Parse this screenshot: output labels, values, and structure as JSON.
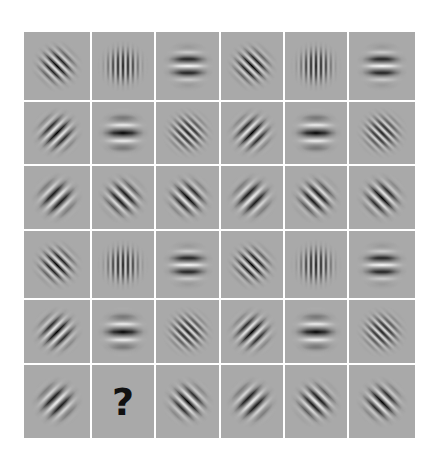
{
  "puzzle": {
    "title": "Gabor patch matrix puzzle",
    "rows": 6,
    "cols": 6,
    "background_color": "#a9a9a9",
    "gridline_color": "#ffffff",
    "missing_marker": "?",
    "missing_position": {
      "row": 6,
      "col": 2
    },
    "cells": [
      [
        {
          "type": "gabor",
          "orientation": "diagonal-down",
          "angle": 45,
          "period": 7,
          "phase": "dark-center"
        },
        {
          "type": "gabor",
          "orientation": "vertical",
          "angle": 0,
          "period": 5,
          "phase": "dark-center"
        },
        {
          "type": "gabor",
          "orientation": "horizontal",
          "angle": 90,
          "period": 14,
          "phase": "light-center"
        },
        {
          "type": "gabor",
          "orientation": "diagonal-down",
          "angle": 45,
          "period": 7,
          "phase": "dark-center"
        },
        {
          "type": "gabor",
          "orientation": "vertical",
          "angle": 0,
          "period": 5,
          "phase": "dark-center"
        },
        {
          "type": "gabor",
          "orientation": "horizontal",
          "angle": 90,
          "period": 14,
          "phase": "light-center"
        }
      ],
      [
        {
          "type": "gabor",
          "orientation": "diagonal-up",
          "angle": -45,
          "period": 9,
          "phase": "dark-center"
        },
        {
          "type": "gabor",
          "orientation": "horizontal",
          "angle": 90,
          "period": 16,
          "phase": "dark-center"
        },
        {
          "type": "gabor",
          "orientation": "diagonal-down",
          "angle": 45,
          "period": 6,
          "phase": "dark-center"
        },
        {
          "type": "gabor",
          "orientation": "diagonal-up",
          "angle": -45,
          "period": 9,
          "phase": "dark-center"
        },
        {
          "type": "gabor",
          "orientation": "horizontal",
          "angle": 90,
          "period": 16,
          "phase": "dark-center"
        },
        {
          "type": "gabor",
          "orientation": "diagonal-down",
          "angle": 45,
          "period": 6,
          "phase": "dark-center"
        }
      ],
      [
        {
          "type": "gabor",
          "orientation": "diagonal-up",
          "angle": -45,
          "period": 11,
          "phase": "light-center"
        },
        {
          "type": "gabor",
          "orientation": "diagonal-down",
          "angle": 45,
          "period": 9,
          "phase": "light-center"
        },
        {
          "type": "gabor",
          "orientation": "diagonal-down",
          "angle": 45,
          "period": 9,
          "phase": "dark-center"
        },
        {
          "type": "gabor",
          "orientation": "diagonal-up",
          "angle": -45,
          "period": 11,
          "phase": "light-center"
        },
        {
          "type": "gabor",
          "orientation": "diagonal-down",
          "angle": 45,
          "period": 9,
          "phase": "light-center"
        },
        {
          "type": "gabor",
          "orientation": "diagonal-down",
          "angle": 45,
          "period": 9,
          "phase": "dark-center"
        }
      ],
      [
        {
          "type": "gabor",
          "orientation": "diagonal-down",
          "angle": 45,
          "period": 7,
          "phase": "dark-center"
        },
        {
          "type": "gabor",
          "orientation": "vertical",
          "angle": 0,
          "period": 5,
          "phase": "dark-center"
        },
        {
          "type": "gabor",
          "orientation": "horizontal",
          "angle": 90,
          "period": 14,
          "phase": "light-center"
        },
        {
          "type": "gabor",
          "orientation": "diagonal-down",
          "angle": 45,
          "period": 7,
          "phase": "dark-center"
        },
        {
          "type": "gabor",
          "orientation": "vertical",
          "angle": 0,
          "period": 5,
          "phase": "dark-center"
        },
        {
          "type": "gabor",
          "orientation": "horizontal",
          "angle": 90,
          "period": 14,
          "phase": "light-center"
        }
      ],
      [
        {
          "type": "gabor",
          "orientation": "diagonal-up",
          "angle": -45,
          "period": 9,
          "phase": "dark-center"
        },
        {
          "type": "gabor",
          "orientation": "horizontal",
          "angle": 90,
          "period": 16,
          "phase": "dark-center"
        },
        {
          "type": "gabor",
          "orientation": "diagonal-down",
          "angle": 45,
          "period": 6,
          "phase": "dark-center"
        },
        {
          "type": "gabor",
          "orientation": "diagonal-up",
          "angle": -45,
          "period": 9,
          "phase": "dark-center"
        },
        {
          "type": "gabor",
          "orientation": "horizontal",
          "angle": 90,
          "period": 16,
          "phase": "dark-center"
        },
        {
          "type": "gabor",
          "orientation": "diagonal-down",
          "angle": 45,
          "period": 6,
          "phase": "dark-center"
        }
      ],
      [
        {
          "type": "gabor",
          "orientation": "diagonal-up",
          "angle": -45,
          "period": 11,
          "phase": "light-center"
        },
        {
          "type": "question",
          "label": "?"
        },
        {
          "type": "gabor",
          "orientation": "diagonal-down",
          "angle": 45,
          "period": 9,
          "phase": "dark-center"
        },
        {
          "type": "gabor",
          "orientation": "diagonal-up",
          "angle": -45,
          "period": 11,
          "phase": "light-center"
        },
        {
          "type": "gabor",
          "orientation": "diagonal-down",
          "angle": 45,
          "period": 9,
          "phase": "light-center"
        },
        {
          "type": "gabor",
          "orientation": "diagonal-down",
          "angle": 45,
          "period": 9,
          "phase": "dark-center"
        }
      ]
    ]
  }
}
